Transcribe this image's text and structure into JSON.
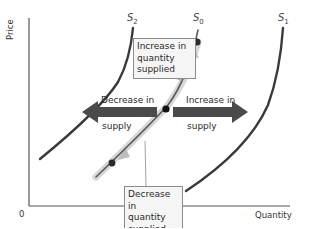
{
  "diagram": {
    "axes": {
      "y_label": "Price",
      "x_label": "Quantity",
      "origin_label": "0"
    },
    "curves": [
      {
        "id": "S2",
        "name": "S",
        "subscript": "2",
        "role": "decreased supply curve (shifted left)"
      },
      {
        "id": "S0",
        "name": "S",
        "subscript": "0",
        "role": "original supply curve"
      },
      {
        "id": "S1",
        "name": "S",
        "subscript": "1",
        "role": "increased supply curve (shifted right)"
      }
    ],
    "arrows": {
      "left": {
        "line1": "Decrease in",
        "line2": "supply",
        "direction": "left"
      },
      "right": {
        "line1": "Increase in",
        "line2": "supply",
        "direction": "right"
      }
    },
    "callouts": {
      "top": {
        "line1": "Increase in",
        "line2": "quantity",
        "line3": "supplied"
      },
      "bottom": {
        "line1": "Decrease in",
        "line2": "quantity",
        "line3": "supplied"
      }
    },
    "colors": {
      "curve": "#3a3a3a",
      "shift_arrow": "#4a4a4a",
      "movement_arrow": "#b8b8b8",
      "point": "#111111",
      "axis": "#555555",
      "box_fill": "#f5f5f5",
      "box_border": "#8c8c8c"
    }
  }
}
